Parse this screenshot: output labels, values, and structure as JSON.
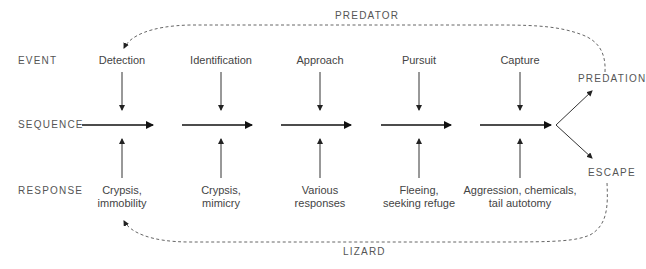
{
  "row_labels": {
    "event": "EVENT",
    "sequence": "SEQUENCE",
    "response": "RESPONSE"
  },
  "loops": {
    "top": "PREDATOR",
    "bottom": "LIZARD"
  },
  "outcomes": {
    "predation": "PREDATION",
    "escape": "ESCAPE"
  },
  "stages": [
    {
      "event": "Detection",
      "response_line1": "Crypsis,",
      "response_line2": "immobility"
    },
    {
      "event": "Identification",
      "response_line1": "Crypsis,",
      "response_line2": "mimicry"
    },
    {
      "event": "Approach",
      "response_line1": "Various",
      "response_line2": "responses"
    },
    {
      "event": "Pursuit",
      "response_line1": "Fleeing,",
      "response_line2": "seeking refuge"
    },
    {
      "event": "Capture",
      "response_line1": "Aggression, chemicals,",
      "response_line2": "tail autotomy"
    }
  ],
  "colors": {
    "line": "#222222",
    "dashed": "#666666",
    "text": "#444444"
  }
}
